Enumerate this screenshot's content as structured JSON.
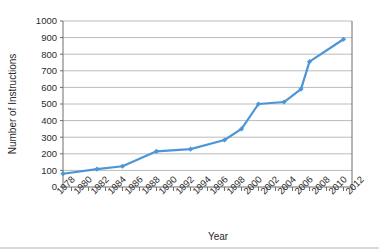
{
  "chart_data": {
    "type": "line",
    "title": "",
    "subtitle": "",
    "xlabel": "Year",
    "ylabel": "Number of Instructions",
    "xlim": [
      1978,
      2012
    ],
    "ylim": [
      0,
      1000
    ],
    "ytick_step": 100,
    "xtick_step": 2,
    "grid": "horizontal",
    "legend": "none",
    "series_color": "#4a96d6",
    "marker": "diamond",
    "yticks": [
      0,
      100,
      200,
      300,
      400,
      500,
      600,
      700,
      800,
      900,
      1000
    ],
    "ytick_labels": [
      "0",
      "100",
      "200",
      "300",
      "400",
      "500",
      "600",
      "700",
      "800",
      "900",
      "1000"
    ],
    "xticks": [
      1978,
      1980,
      1982,
      1984,
      1986,
      1988,
      1990,
      1992,
      1994,
      1996,
      1998,
      2000,
      2002,
      2004,
      2006,
      2008,
      2010,
      2012
    ],
    "xtick_labels": [
      "1978",
      "1980",
      "1982",
      "1984",
      "1986",
      "1988",
      "1990",
      "1992",
      "1994",
      "1996",
      "1998",
      "2000",
      "2002",
      "2004",
      "2006",
      "2008",
      "2010",
      "2012"
    ],
    "xtick_minor_step": 1,
    "series": [
      {
        "name": "Number of Instructions",
        "x": [
          1978,
          1982,
          1985,
          1989,
          1993,
          1997,
          1999,
          2001,
          2004,
          2006,
          2007,
          2011
        ],
        "values": [
          80,
          108,
          125,
          215,
          228,
          283,
          350,
          500,
          512,
          590,
          755,
          890
        ]
      }
    ]
  },
  "axes": {
    "y_axis_label": "Number of Instructions",
    "x_axis_label": "Year"
  }
}
